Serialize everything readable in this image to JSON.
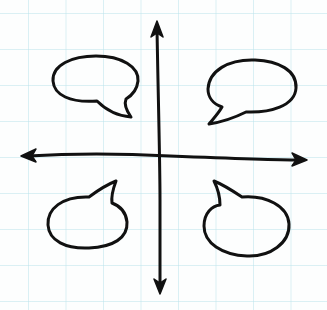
{
  "diagram": {
    "type": "quadrant-sketch",
    "colors": {
      "ink": "#111111",
      "grid": "#bee4ec",
      "paper": "#fdfefe"
    },
    "axes": {
      "horizontal": {
        "arrows": "both-ends"
      },
      "vertical": {
        "arrows": "both-ends"
      }
    },
    "quadrants": [
      {
        "position": "top-left",
        "content": "empty speech bubble",
        "tail_direction": "down-right"
      },
      {
        "position": "top-right",
        "content": "empty speech bubble",
        "tail_direction": "down-left"
      },
      {
        "position": "bottom-left",
        "content": "empty speech bubble",
        "tail_direction": "up-right"
      },
      {
        "position": "bottom-right",
        "content": "empty speech bubble",
        "tail_direction": "up-left"
      }
    ]
  }
}
